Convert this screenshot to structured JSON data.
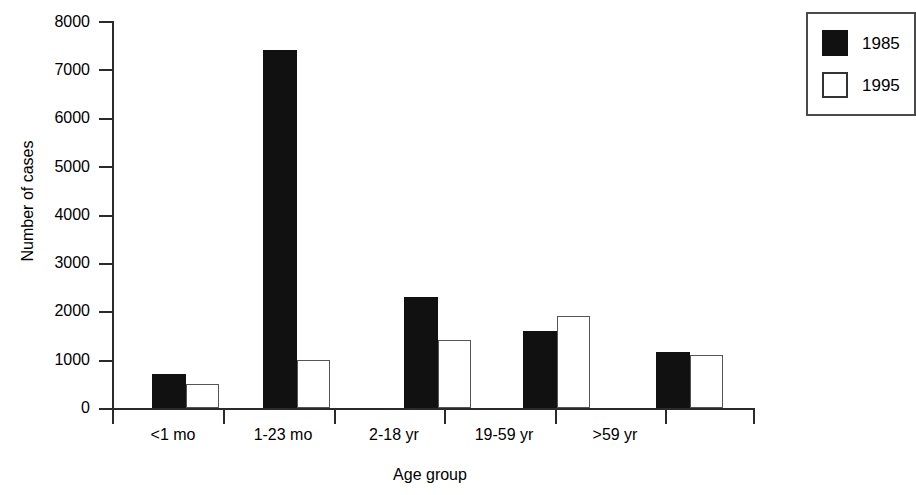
{
  "chart_data": {
    "type": "bar",
    "title": "",
    "xlabel": "Age group",
    "ylabel": "Number of cases",
    "categories": [
      "<1 mo",
      "1-23 mo",
      "2-18 yr",
      "19-59 yr",
      ">59 yr"
    ],
    "series": [
      {
        "name": "1985",
        "color": "#111111",
        "values": [
          700,
          7400,
          2300,
          1600,
          1150
        ]
      },
      {
        "name": "1995",
        "color": "#ffffff",
        "values": [
          500,
          1000,
          1400,
          1900,
          1100
        ]
      }
    ],
    "ylim": [
      0,
      8000
    ],
    "yticks": [
      0,
      1000,
      2000,
      3000,
      4000,
      5000,
      6000,
      7000,
      8000
    ],
    "ytick_labels": [
      "0",
      "1000",
      "2000",
      "3000",
      "4000",
      "5000",
      "6000",
      "7000",
      "8000"
    ],
    "grid": false,
    "legend_position": "top-right",
    "legend_entries": [
      {
        "label": "1985",
        "swatch": "filled-black-square"
      },
      {
        "label": "1995",
        "swatch": "open-white-square"
      }
    ]
  }
}
